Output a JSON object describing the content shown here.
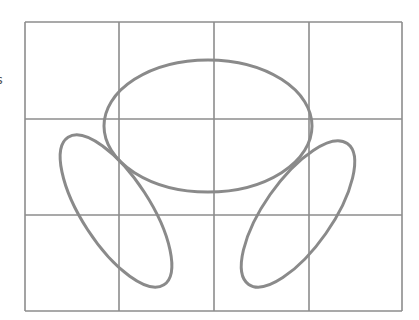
{
  "diagram": {
    "type": "grid-with-ellipses",
    "edge_text": "s",
    "colors": {
      "background": "#ffffff",
      "grid": "#8c8c8c",
      "shapes": "#8a8a8a"
    },
    "grid": {
      "left": 25,
      "top": 22,
      "right": 402,
      "bottom": 311,
      "columns": 4,
      "rows": 3,
      "x_lines": [
        25,
        119,
        214,
        309,
        402
      ],
      "y_lines": [
        22,
        119,
        215,
        311
      ]
    },
    "ellipses": [
      {
        "name": "top-ellipse",
        "cx": 208,
        "cy": 126,
        "rx": 104,
        "ry": 66,
        "rotate": 0
      },
      {
        "name": "left-ellipse",
        "cx": 116,
        "cy": 211,
        "rx": 88,
        "ry": 34,
        "rotate": 57
      },
      {
        "name": "right-ellipse",
        "cx": 298,
        "cy": 214,
        "rx": 86,
        "ry": 34,
        "rotate": -55
      }
    ]
  }
}
